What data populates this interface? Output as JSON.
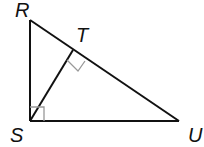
{
  "diagram": {
    "type": "geometry",
    "points": {
      "R": {
        "label": "R",
        "x": 30,
        "y": 20
      },
      "S": {
        "label": "S",
        "x": 30,
        "y": 121
      },
      "U": {
        "label": "U",
        "x": 179,
        "y": 121
      },
      "T": {
        "label": "T",
        "x": 73,
        "y": 50
      }
    },
    "segments": [
      {
        "from": "R",
        "to": "S"
      },
      {
        "from": "S",
        "to": "U"
      },
      {
        "from": "R",
        "to": "U"
      },
      {
        "from": "S",
        "to": "T"
      }
    ],
    "right_angles": [
      "S",
      "T"
    ],
    "colors": {
      "line": "#111111",
      "marker": "#999999"
    }
  }
}
